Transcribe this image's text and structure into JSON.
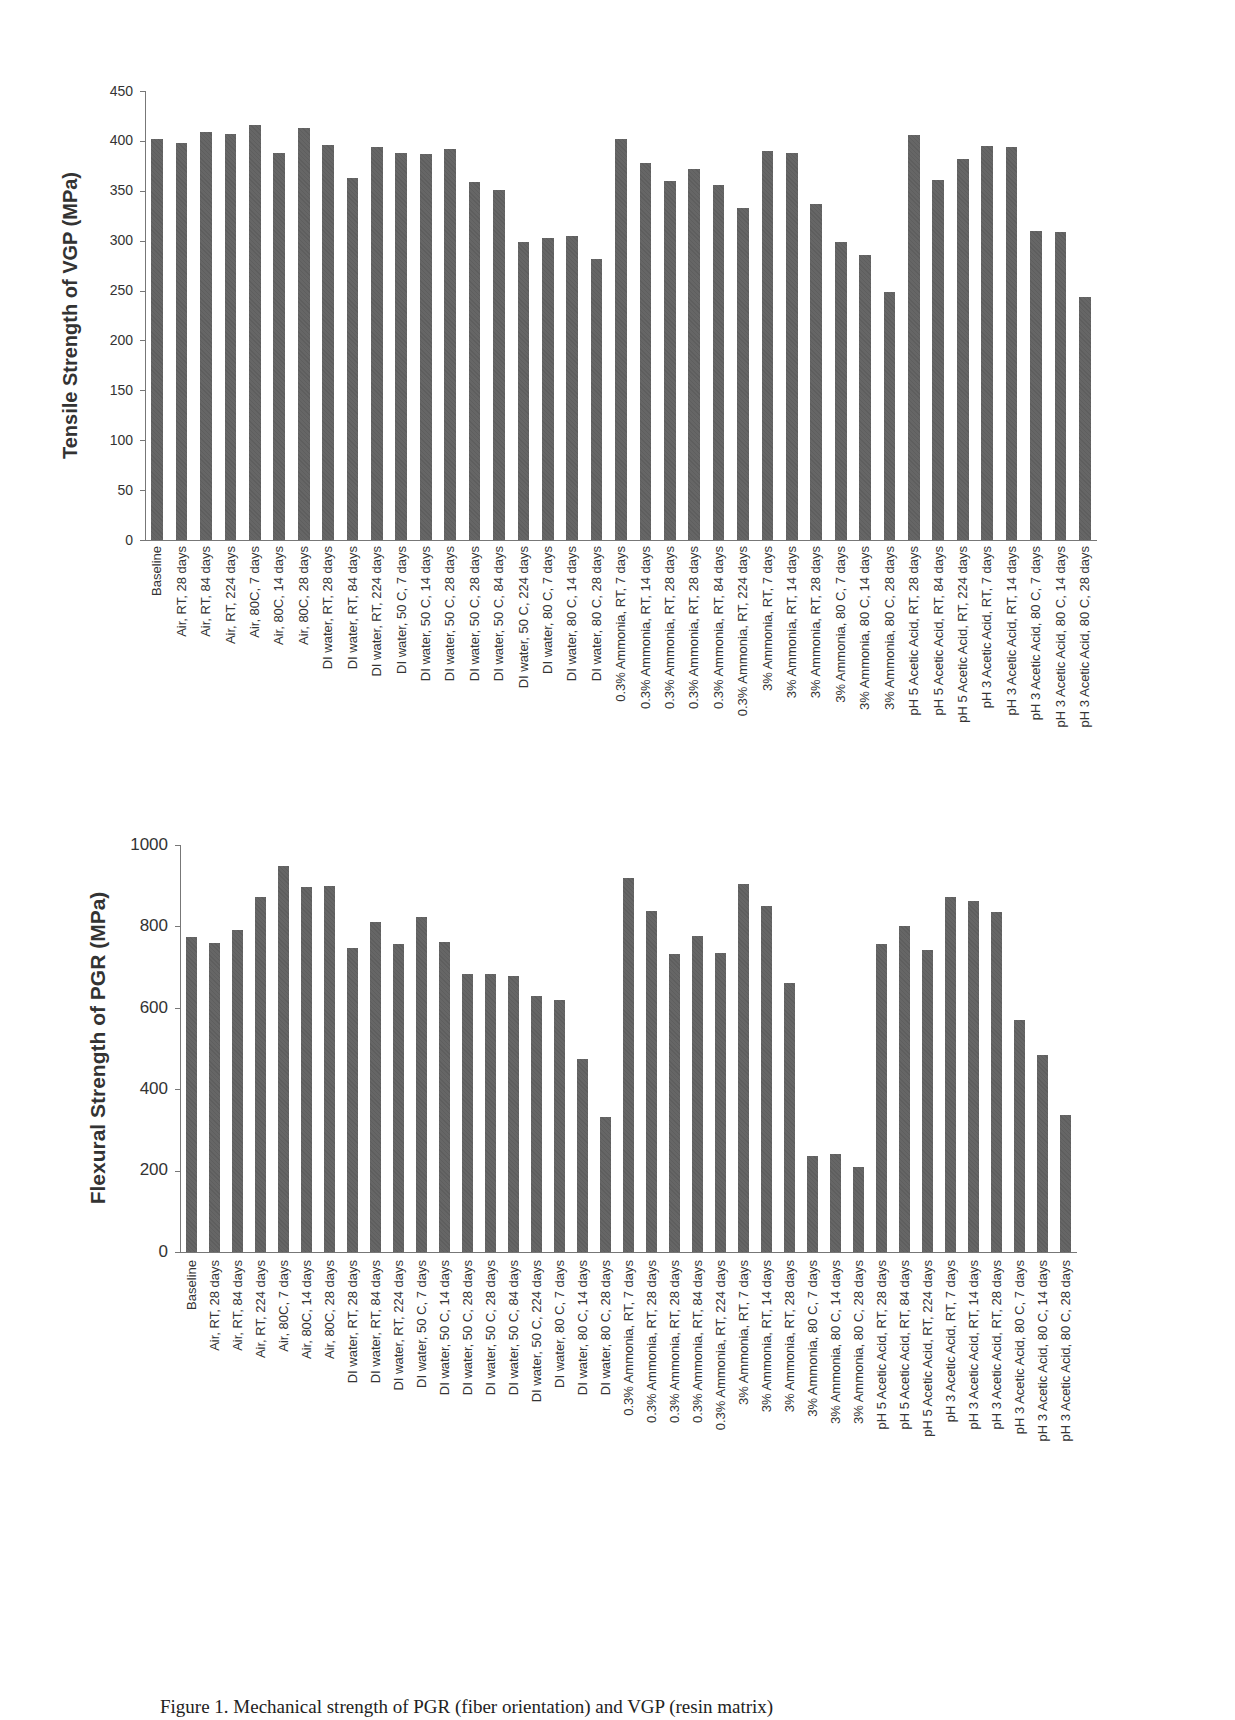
{
  "chart_data": [
    {
      "type": "bar",
      "title": "",
      "xlabel": "",
      "ylabel": "Tensile Strength of VGP (MPa)",
      "ylim": [
        0,
        450
      ],
      "yticks": [
        0,
        50,
        100,
        150,
        200,
        250,
        300,
        350,
        400,
        450
      ],
      "grid": false,
      "legend": null,
      "categories": [
        "Baseline",
        "Air, RT, 28 days",
        "Air, RT, 84 days",
        "Air, RT, 224 days",
        "Air, 80C, 7 days",
        "Air, 80C, 14 days",
        "Air, 80C, 28 days",
        "DI water, RT, 28 days",
        "DI water, RT, 84 days",
        "DI water, RT, 224 days",
        "DI water, 50 C, 7 days",
        "DI water, 50 C, 14 days",
        "DI water, 50 C, 28 days",
        "DI water, 50 C, 28 days",
        "DI water, 50 C, 84 days",
        "DI water, 50 C, 224 days",
        "DI water, 80 C, 7 days",
        "DI water, 80 C, 14 days",
        "DI water, 80 C, 28 days",
        "0.3% Ammonia, RT, 7 days",
        "0.3% Ammonia, RT, 14 days",
        "0.3% Ammonia, RT, 28 days",
        "0.3% Ammonia, RT, 28 days",
        "0.3% Ammonia, RT, 84 days",
        "0.3% Ammonia, RT, 224 days",
        "3% Ammonia, RT, 7 days",
        "3% Ammonia, RT, 14 days",
        "3% Ammonia, RT, 28 days",
        "3% Ammonia, 80 C, 7 days",
        "3% Ammonia, 80 C, 14 days",
        "3% Ammonia, 80 C, 28 days",
        "pH 5 Acetic Acid, RT, 28 days",
        "pH 5 Acetic Acid, RT, 84 days",
        "pH 5 Acetic Acid, RT, 224 days",
        "pH 3 Acetic Acid, RT, 7 days",
        "pH 3 Acetic Acid, RT, 14 days",
        "pH 3 Acetic Acid, 80 C, 7 days",
        "pH 3 Acetic Acid, 80 C, 14 days",
        "pH 3 Acetic Acid, 80 C, 28 days"
      ],
      "values": [
        402,
        398,
        409,
        407,
        416,
        388,
        413,
        396,
        363,
        394,
        388,
        387,
        392,
        359,
        351,
        299,
        303,
        305,
        282,
        402,
        378,
        360,
        372,
        356,
        333,
        390,
        388,
        337,
        299,
        286,
        249,
        406,
        361,
        382,
        395,
        394,
        310,
        309,
        244
      ],
      "bar_color": "#666666"
    },
    {
      "type": "bar",
      "title": "",
      "xlabel": "",
      "ylabel": "Flexural Strength of PGR (MPa)",
      "ylim": [
        0,
        1000
      ],
      "yticks": [
        0,
        200,
        400,
        600,
        800,
        1000
      ],
      "grid": false,
      "legend": null,
      "categories": [
        "Baseline",
        "Air, RT, 28 days",
        "Air, RT, 84 days",
        "Air, RT, 224 days",
        "Air, 80C, 7 days",
        "Air, 80C, 14 days",
        "Air, 80C, 28 days",
        "DI water, RT, 28 days",
        "DI water, RT, 84 days",
        "DI water, RT, 224 days",
        "DI water, 50 C, 7 days",
        "DI water, 50 C, 14 days",
        "DI water, 50 C, 28 days",
        "DI water, 50 C, 28 days",
        "DI water, 50 C, 84 days",
        "DI water, 50 C, 224 days",
        "DI water, 80 C, 7 days",
        "DI water, 80 C, 14 days",
        "DI water, 80 C, 28 days",
        "0.3% Ammonia, RT, 7 days",
        "0.3% Ammonia, RT, 28 days",
        "0.3% Ammonia, RT, 28 days",
        "0.3% Ammonia, RT, 84 days",
        "0.3% Ammonia, RT, 224 days",
        "3% Ammonia, RT, 7 days",
        "3% Ammonia, RT, 14 days",
        "3% Ammonia, RT, 28 days",
        "3% Ammonia, 80 C, 7 days",
        "3% Ammonia, 80 C, 14 days",
        "3% Ammonia, 80 C, 28 days",
        "pH 5 Acetic Acid, RT, 28 days",
        "pH 5 Acetic Acid, RT, 84 days",
        "pH 5 Acetic Acid, RT, 224 days",
        "pH 3 Acetic Acid, RT, 7 days",
        "pH 3 Acetic Acid, RT, 14 days",
        "pH 3 Acetic Acid, RT, 28 days",
        "pH 3 Acetic Acid, 80 C, 7 days",
        "pH 3 Acetic Acid, 80 C, 14 days",
        "pH 3 Acetic Acid, 80 C, 28 days"
      ],
      "values": [
        773,
        759,
        790,
        872,
        949,
        897,
        900,
        747,
        811,
        757,
        823,
        762,
        682,
        682,
        679,
        630,
        619,
        475,
        331,
        920,
        838,
        731,
        776,
        735,
        904,
        849,
        661,
        235,
        240,
        210,
        757,
        800,
        742,
        873,
        862,
        836,
        570,
        483,
        337
      ],
      "bar_color": "#666666"
    }
  ],
  "caption": "Figure 1.  Mechanical strength of  PGR (fiber orientation) and VGP (resin matrix)"
}
